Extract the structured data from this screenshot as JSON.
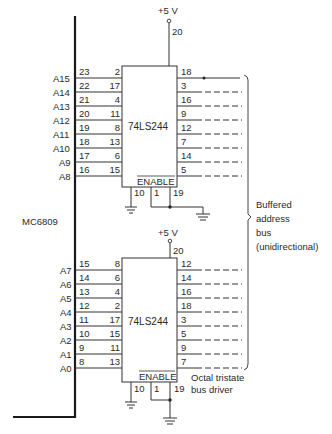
{
  "processor": {
    "name": "MC6809"
  },
  "supply_label": "+5 V",
  "supply_pin": "20",
  "chips": [
    {
      "part": "74LS244",
      "enable_label": "ENABLE",
      "enable_pins": [
        "10",
        "1",
        "19"
      ],
      "rows": [
        {
          "addr": "A15",
          "cpu_pin": "23",
          "in_pin": "2",
          "out_pin": "18"
        },
        {
          "addr": "A14",
          "cpu_pin": "22",
          "in_pin": "17",
          "out_pin": "3"
        },
        {
          "addr": "A13",
          "cpu_pin": "21",
          "in_pin": "4",
          "out_pin": "16"
        },
        {
          "addr": "A12",
          "cpu_pin": "20",
          "in_pin": "11",
          "out_pin": "9"
        },
        {
          "addr": "A11",
          "cpu_pin": "19",
          "in_pin": "8",
          "out_pin": "12"
        },
        {
          "addr": "A10",
          "cpu_pin": "18",
          "in_pin": "13",
          "out_pin": "7"
        },
        {
          "addr": "A9",
          "cpu_pin": "17",
          "in_pin": "6",
          "out_pin": "14"
        },
        {
          "addr": "A8",
          "cpu_pin": "16",
          "in_pin": "15",
          "out_pin": "5"
        }
      ]
    },
    {
      "part": "74LS244",
      "enable_label": "ENABLE",
      "enable_pins": [
        "10",
        "1",
        "19"
      ],
      "rows": [
        {
          "addr": "A7",
          "cpu_pin": "15",
          "in_pin": "8",
          "out_pin": "12"
        },
        {
          "addr": "A6",
          "cpu_pin": "14",
          "in_pin": "6",
          "out_pin": "14"
        },
        {
          "addr": "A5",
          "cpu_pin": "13",
          "in_pin": "4",
          "out_pin": "16"
        },
        {
          "addr": "A4",
          "cpu_pin": "12",
          "in_pin": "2",
          "out_pin": "18"
        },
        {
          "addr": "A3",
          "cpu_pin": "11",
          "in_pin": "17",
          "out_pin": "3"
        },
        {
          "addr": "A2",
          "cpu_pin": "10",
          "in_pin": "15",
          "out_pin": "5"
        },
        {
          "addr": "A1",
          "cpu_pin": "9",
          "in_pin": "11",
          "out_pin": "9"
        },
        {
          "addr": "A0",
          "cpu_pin": "8",
          "in_pin": "13",
          "out_pin": "7"
        }
      ]
    }
  ],
  "bus_note": [
    "Buffered",
    "address",
    "bus",
    "(unidirectional)"
  ],
  "driver_note": [
    "Octal tristate",
    "bus driver"
  ]
}
